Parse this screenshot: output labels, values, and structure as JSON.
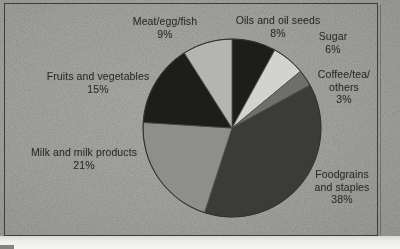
{
  "chart_data": {
    "type": "pie",
    "title": "",
    "subtitle": "",
    "xlabel": "",
    "ylabel": "",
    "legend_position": "labels-around-slices",
    "grid": false,
    "units": "percent",
    "total": 100,
    "categories": [
      "Oils and oil seeds",
      "Sugar",
      "Coffee/tea/ others",
      "Foodgrains and staples",
      "Milk and milk products",
      "Fruits and vegetables",
      "Meat/egg/fish"
    ],
    "values": [
      8,
      6,
      3,
      38,
      21,
      15,
      9
    ],
    "slices": [
      {
        "name": "Oils and oil seeds",
        "label_lines": [
          "Oils and oil seeds"
        ],
        "value": 8,
        "value_text": "8%",
        "color": "#1d1d1c",
        "start_deg": 0,
        "end_deg": 28.8
      },
      {
        "name": "Sugar",
        "label_lines": [
          "Sugar"
        ],
        "value": 6,
        "value_text": "6%",
        "color": "#d2d2cf",
        "start_deg": 28.8,
        "end_deg": 50.4
      },
      {
        "name": "Coffee/tea/ others",
        "label_lines": [
          "Coffee/tea/",
          "others"
        ],
        "value": 3,
        "value_text": "3%",
        "color": "#6e6e6b",
        "start_deg": 50.4,
        "end_deg": 61.2
      },
      {
        "name": "Foodgrains and staples",
        "label_lines": [
          "Foodgrains",
          "and staples"
        ],
        "value": 38,
        "value_text": "38%",
        "color": "#3b3b39",
        "start_deg": 61.2,
        "end_deg": 198.0
      },
      {
        "name": "Milk and milk products",
        "label_lines": [
          "Milk and milk products"
        ],
        "value": 21,
        "value_text": "21%",
        "color": "#8e8e8b",
        "start_deg": 198.0,
        "end_deg": 273.6
      },
      {
        "name": "Fruits and vegetables",
        "label_lines": [
          "Fruits and vegetables"
        ],
        "value": 15,
        "value_text": "15%",
        "color": "#1d1d1c",
        "start_deg": 273.6,
        "end_deg": 327.6
      },
      {
        "name": "Meat/egg/fish",
        "label_lines": [
          "Meat/egg/fish"
        ],
        "value": 9,
        "value_text": "9%",
        "color": "#b4b4b1",
        "start_deg": 327.6,
        "end_deg": 360.0
      }
    ],
    "geometry": {
      "center_x": 232,
      "center_y": 128,
      "radius": 89,
      "start_angle_deg": 0,
      "direction": "clockwise"
    },
    "palette": {
      "background": "#a9a9a6",
      "frame": "#3c3c3a",
      "text": "#2a2a28"
    }
  },
  "labels": {
    "meat": {
      "line1": "Meat/egg/fish",
      "pct": "9%"
    },
    "oils": {
      "line1": "Oils and oil seeds",
      "pct": "8%"
    },
    "sugar": {
      "line1": "Sugar",
      "pct": "6%"
    },
    "coffee": {
      "line1": "Coffee/tea/",
      "line2": "others",
      "pct": "3%"
    },
    "foodgrains": {
      "line1": "Foodgrains",
      "line2": "and staples",
      "pct": "38%"
    },
    "milk": {
      "line1": "Milk and milk products",
      "pct": "21%"
    },
    "fruits": {
      "line1": "Fruits and vegetables",
      "pct": "15%"
    }
  }
}
